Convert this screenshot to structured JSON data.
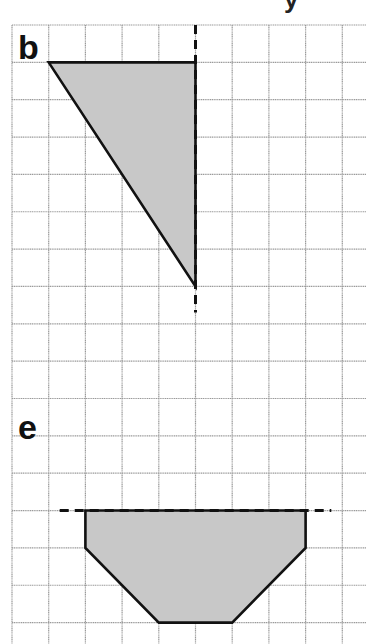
{
  "page": {
    "cropped_header_glyph": "y"
  },
  "grid": {
    "origin_x": 12,
    "origin_y": 25,
    "cell_w": 36.7,
    "cell_h": 37.35,
    "cols": 10,
    "rows": 17,
    "line_color": "#9a9a9a"
  },
  "colors": {
    "shape_fill": "#c8c8c8",
    "shape_stroke": "#111111",
    "mirror_line": "#111111",
    "background": "#ffffff"
  },
  "panels": [
    {
      "label": "b",
      "label_pos": [
        18,
        30
      ],
      "shape_name": "right-triangle",
      "points_grid": [
        [
          1,
          1
        ],
        [
          5,
          1
        ],
        [
          5,
          7
        ]
      ],
      "mirror_line": {
        "orientation": "vertical",
        "from_grid": [
          5,
          0
        ],
        "to_grid": [
          5,
          7.7
        ]
      }
    },
    {
      "label": "e",
      "label_pos": [
        18,
        410
      ],
      "shape_name": "hexagon-trapezoid",
      "points_grid": [
        [
          2,
          13
        ],
        [
          8,
          13
        ],
        [
          8,
          14
        ],
        [
          6,
          16
        ],
        [
          4,
          16
        ],
        [
          2,
          14
        ]
      ],
      "mirror_line": {
        "orientation": "horizontal",
        "from_grid": [
          1.3,
          13
        ],
        "to_grid": [
          8.7,
          13
        ]
      }
    }
  ]
}
